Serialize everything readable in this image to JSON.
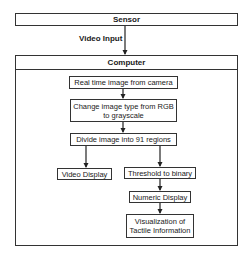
{
  "diagram": {
    "sensor": {
      "label": "Sensor"
    },
    "edge_sensor_computer": {
      "label": "Video Input"
    },
    "computer": {
      "label": "Computer",
      "steps": {
        "camera": "Real time image from camera",
        "grayscale_line1": "Change image type from RGB",
        "grayscale_line2": "to grayscale",
        "divide": "Divide image into 91 regions",
        "video_display": "Video Display",
        "threshold": "Threshold to binary",
        "numeric": "Numeric Display",
        "visualization_line1": "Visualization of",
        "visualization_line2": "Tactile Information"
      }
    },
    "colors": {
      "stroke": "#333333",
      "background": "#ffffff",
      "text": "#1a1a1a"
    }
  }
}
